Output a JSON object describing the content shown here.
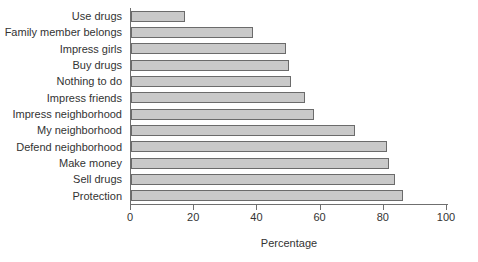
{
  "chart_data": {
    "type": "bar",
    "orientation": "horizontal",
    "title": "",
    "subtitle": "",
    "xlabel": "Percentage",
    "ylabel": "",
    "xlim": [
      0,
      100
    ],
    "xticks": [
      0,
      20,
      40,
      60,
      80,
      100
    ],
    "xtick_labels": [
      "0",
      "20",
      "40",
      "60",
      "80",
      "100"
    ],
    "grid": false,
    "legend": null,
    "bar_color": "#c9c9c9",
    "bar_edge_color": "#6b6b6b",
    "axis_color": "#6f6f6f",
    "categories": [
      "Use drugs",
      "Family member belongs",
      "Impress girls",
      "Buy drugs",
      "Nothing to do",
      "Impress friends",
      "Impress neighborhood",
      "My neighborhood",
      "Defend neighborhood",
      "Make money",
      "Sell drugs",
      "Protection"
    ],
    "values": [
      17,
      38.5,
      49,
      50,
      50.5,
      55,
      58,
      71,
      81,
      81.5,
      83.5,
      86
    ]
  }
}
